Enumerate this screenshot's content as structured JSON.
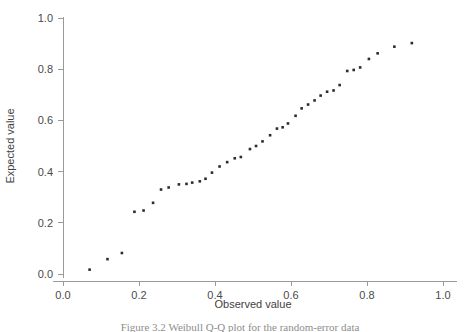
{
  "figure": {
    "caption": "Figure 3.2  Weibull Q-Q plot for the random-error data"
  },
  "chart_data": {
    "type": "scatter",
    "title": "",
    "xlabel": "Observed value",
    "ylabel": "Expected value",
    "xlim": [
      0.0,
      1.0
    ],
    "ylim": [
      0.0,
      1.0
    ],
    "xticks": [
      "0.0",
      "0.2",
      "0.4",
      "0.6",
      "0.8",
      "1.0"
    ],
    "xtick_values": [
      0.0,
      0.2,
      0.4,
      0.6,
      0.8,
      1.0
    ],
    "yticks": [
      "0.0",
      "0.2",
      "0.4",
      "0.6",
      "0.8",
      "1.0"
    ],
    "ytick_values": [
      0.0,
      0.2,
      0.4,
      0.6,
      0.8,
      1.0
    ],
    "grid": false,
    "legend": null,
    "marker": "square",
    "marker_color": "#2b2b33",
    "marker_size": 2.6,
    "series": [
      {
        "name": "Q-Q points",
        "x": [
          0.07,
          0.117,
          0.155,
          0.188,
          0.212,
          0.237,
          0.258,
          0.278,
          0.305,
          0.325,
          0.34,
          0.36,
          0.375,
          0.392,
          0.412,
          0.432,
          0.452,
          0.468,
          0.492,
          0.508,
          0.525,
          0.545,
          0.563,
          0.578,
          0.592,
          0.612,
          0.628,
          0.645,
          0.662,
          0.678,
          0.695,
          0.712,
          0.728,
          0.748,
          0.765,
          0.782,
          0.805,
          0.828,
          0.872,
          0.918
        ],
        "y": [
          0.017,
          0.058,
          0.082,
          0.243,
          0.248,
          0.278,
          0.33,
          0.338,
          0.35,
          0.352,
          0.357,
          0.362,
          0.372,
          0.396,
          0.42,
          0.437,
          0.452,
          0.457,
          0.488,
          0.5,
          0.518,
          0.542,
          0.568,
          0.573,
          0.588,
          0.618,
          0.647,
          0.662,
          0.678,
          0.697,
          0.712,
          0.717,
          0.738,
          0.793,
          0.797,
          0.807,
          0.84,
          0.862,
          0.888,
          0.902
        ]
      }
    ]
  },
  "layout": {
    "plot_left_px": 63,
    "plot_right_px": 443,
    "plot_top_px": 18,
    "plot_bottom_px": 274
  }
}
